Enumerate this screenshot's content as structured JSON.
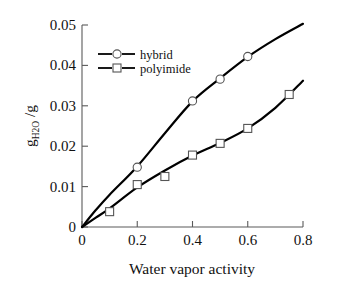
{
  "chart_data": {
    "type": "line",
    "title": "",
    "xlabel": "Water vapor activity",
    "ylabel": "g H2O /g",
    "ylabel_parts": {
      "lead": "g",
      "sub": "H",
      "sub2": "2",
      "sub3": "O",
      "tail": " /g"
    },
    "xlim": [
      0,
      0.8
    ],
    "ylim": [
      0,
      0.05
    ],
    "xticks": [
      "0",
      "0.2",
      "0.4",
      "0.6",
      "0.8"
    ],
    "xtick_values": [
      0,
      0.2,
      0.4,
      0.6,
      0.8
    ],
    "yticks": [
      "0",
      "0.01",
      "0.02",
      "0.03",
      "0.04",
      "0.05"
    ],
    "ytick_values": [
      0,
      0.01,
      0.02,
      0.03,
      0.04,
      0.05
    ],
    "grid": false,
    "legend_position": "upper-left-inside",
    "series": [
      {
        "name": "hybrid",
        "marker": "circle",
        "points": [
          {
            "x": 0.0,
            "y": 0.0
          },
          {
            "x": 0.2,
            "y": 0.0148
          },
          {
            "x": 0.4,
            "y": 0.0312
          },
          {
            "x": 0.5,
            "y": 0.0366
          },
          {
            "x": 0.6,
            "y": 0.0422
          }
        ],
        "curve": [
          {
            "x": 0.0,
            "y": 0.0
          },
          {
            "x": 0.05,
            "y": 0.0042
          },
          {
            "x": 0.1,
            "y": 0.008
          },
          {
            "x": 0.2,
            "y": 0.015
          },
          {
            "x": 0.3,
            "y": 0.0232
          },
          {
            "x": 0.4,
            "y": 0.0311
          },
          {
            "x": 0.5,
            "y": 0.0368
          },
          {
            "x": 0.6,
            "y": 0.0421
          },
          {
            "x": 0.7,
            "y": 0.0465
          },
          {
            "x": 0.8,
            "y": 0.0503
          }
        ]
      },
      {
        "name": "polyimide",
        "marker": "square",
        "points": [
          {
            "x": 0.0,
            "y": 0.0
          },
          {
            "x": 0.1,
            "y": 0.0038
          },
          {
            "x": 0.2,
            "y": 0.0105
          },
          {
            "x": 0.3,
            "y": 0.0125
          },
          {
            "x": 0.4,
            "y": 0.0178
          },
          {
            "x": 0.5,
            "y": 0.0207
          },
          {
            "x": 0.6,
            "y": 0.0244
          },
          {
            "x": 0.75,
            "y": 0.0328
          }
        ],
        "curve": [
          {
            "x": 0.0,
            "y": 0.0
          },
          {
            "x": 0.05,
            "y": 0.0023
          },
          {
            "x": 0.1,
            "y": 0.0046
          },
          {
            "x": 0.2,
            "y": 0.0098
          },
          {
            "x": 0.3,
            "y": 0.014
          },
          {
            "x": 0.4,
            "y": 0.0177
          },
          {
            "x": 0.5,
            "y": 0.0208
          },
          {
            "x": 0.6,
            "y": 0.0244
          },
          {
            "x": 0.7,
            "y": 0.0295
          },
          {
            "x": 0.8,
            "y": 0.0362
          }
        ]
      }
    ],
    "legend": [
      {
        "label": "hybrid",
        "marker": "circle"
      },
      {
        "label": "polyimide",
        "marker": "square"
      }
    ],
    "colors": {
      "curve": "#000000",
      "axis": "#5a5a5a",
      "marker_fill": "#ffffff",
      "marker_stroke": "#555555"
    }
  }
}
